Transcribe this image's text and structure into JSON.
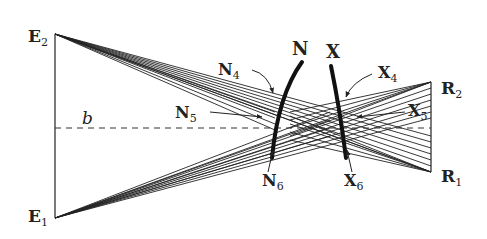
{
  "diagram": {
    "baseline_label": "b",
    "eye_points": [
      {
        "name": "E",
        "sub": "2",
        "x": 55,
        "y": 34
      },
      {
        "name": "E",
        "sub": "1",
        "x": 55,
        "y": 218
      }
    ],
    "retina_points": [
      {
        "name": "R",
        "sub": "2",
        "x": 431,
        "y": 82
      },
      {
        "name": "R",
        "sub": "1",
        "x": 431,
        "y": 172
      }
    ],
    "curves": [
      {
        "name": "N",
        "label": "N"
      },
      {
        "name": "X",
        "label": "X"
      }
    ],
    "annotations": [
      {
        "name": "N",
        "sub": "4"
      },
      {
        "name": "N",
        "sub": "5"
      },
      {
        "name": "N",
        "sub": "6"
      },
      {
        "name": "X",
        "sub": "4"
      },
      {
        "name": "X",
        "sub": "5"
      },
      {
        "name": "X",
        "sub": "6"
      }
    ],
    "colors": {
      "ink": "#222222",
      "background": "#ffffff"
    },
    "ray_count_per_bundle": 8
  }
}
